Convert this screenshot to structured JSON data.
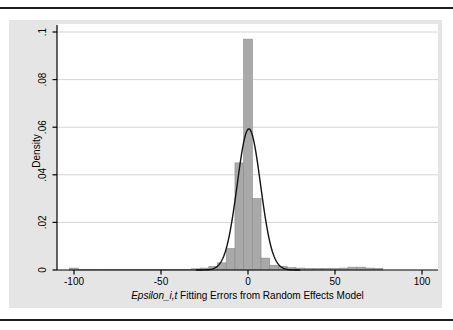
{
  "page": {
    "top_rule_color": "#1c1c1c",
    "bottom_rule_color": "#1c1c1c",
    "background": "#ffffff"
  },
  "chart": {
    "outer_bg": "#e5e5e5",
    "plot_bg": "#ffffff",
    "grid_color": "#d4d4d4",
    "axis_color": "#000000",
    "bar_fill": "#a9a9a9",
    "bar_stroke": "#8a8a8a",
    "curve_color": "#141414",
    "ylabel": "Density",
    "xlabel_italic": "Epsilon_i,t",
    "xlabel_rest": " Fitting Errors from Random Effects Model"
  },
  "chart_data": {
    "type": "bar",
    "subtype": "histogram-with-normal-density-overlay",
    "title": "",
    "xlabel": "Epsilon_i,t Fitting Errors from Random Effects Model",
    "ylabel": "Density",
    "xlim": [
      -110,
      109
    ],
    "ylim": [
      0,
      0.1
    ],
    "grid": "horizontal",
    "legend": "none",
    "x_ticks": [
      {
        "value": -100,
        "label": "-100"
      },
      {
        "value": -50,
        "label": "-50"
      },
      {
        "value": 0,
        "label": "0"
      },
      {
        "value": 50,
        "label": "50"
      },
      {
        "value": 100,
        "label": "100"
      }
    ],
    "y_ticks": [
      {
        "value": 0,
        "label": "0"
      },
      {
        "value": 0.02,
        "label": ".02"
      },
      {
        "value": 0.04,
        "label": ".04"
      },
      {
        "value": 0.06,
        "label": ".06"
      },
      {
        "value": 0.08,
        "label": ".08"
      },
      {
        "value": 0.1,
        "label": ".1"
      }
    ],
    "bin_width": 5,
    "bars": [
      {
        "center": -100,
        "density": 0.0008
      },
      {
        "center": -95,
        "density": 0.0003
      },
      {
        "center": -90,
        "density": 0.0003
      },
      {
        "center": -85,
        "density": 0.0003
      },
      {
        "center": -80,
        "density": 0.0003
      },
      {
        "center": -75,
        "density": 0.0003
      },
      {
        "center": -70,
        "density": 0.0003
      },
      {
        "center": -65,
        "density": 0.0003
      },
      {
        "center": -60,
        "density": 0.0003
      },
      {
        "center": -55,
        "density": 0.0003
      },
      {
        "center": -50,
        "density": 0.0003
      },
      {
        "center": -45,
        "density": 0.0003
      },
      {
        "center": -40,
        "density": 0.0003
      },
      {
        "center": -35,
        "density": 0.0003
      },
      {
        "center": -30,
        "density": 0.0005
      },
      {
        "center": -25,
        "density": 0.0008
      },
      {
        "center": -20,
        "density": 0.0015
      },
      {
        "center": -15,
        "density": 0.003
      },
      {
        "center": -10,
        "density": 0.009
      },
      {
        "center": -5,
        "density": 0.045
      },
      {
        "center": 0,
        "density": 0.097
      },
      {
        "center": 5,
        "density": 0.03
      },
      {
        "center": 10,
        "density": 0.005
      },
      {
        "center": 15,
        "density": 0.002
      },
      {
        "center": 20,
        "density": 0.0015
      },
      {
        "center": 25,
        "density": 0.001
      },
      {
        "center": 30,
        "density": 0.0008
      },
      {
        "center": 35,
        "density": 0.0007
      },
      {
        "center": 40,
        "density": 0.0007
      },
      {
        "center": 45,
        "density": 0.0007
      },
      {
        "center": 50,
        "density": 0.0007
      },
      {
        "center": 55,
        "density": 0.0008
      },
      {
        "center": 60,
        "density": 0.0012
      },
      {
        "center": 65,
        "density": 0.0012
      },
      {
        "center": 70,
        "density": 0.0008
      },
      {
        "center": 75,
        "density": 0.0007
      }
    ],
    "normal_curve": {
      "mean": 0.5,
      "sd": 6.7,
      "peak_density": 0.0593,
      "x_range": [
        -30,
        30
      ]
    }
  }
}
